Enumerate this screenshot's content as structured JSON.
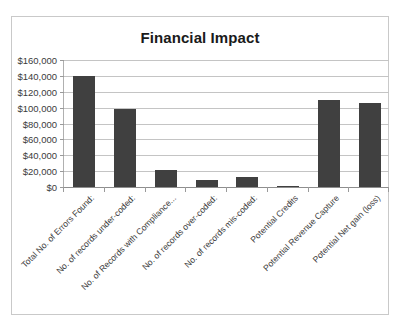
{
  "chart_data": {
    "type": "bar",
    "title": "Financial Impact",
    "xlabel": "",
    "ylabel": "",
    "ylim": [
      0,
      160000
    ],
    "grid": true,
    "legend": "none",
    "currency_prefix": "$",
    "categories": [
      "Total No. of Errors Found:",
      "No. of records under-coded:",
      "No. of Records with Compliance...",
      "No. of records over-coded:",
      "No. of records mis-coded:",
      "Potential Credits",
      "Potential Revenue Capture",
      "Potential Net gain (loss)"
    ],
    "values": [
      140000,
      98000,
      21000,
      9000,
      13000,
      1500,
      109000,
      106000
    ],
    "ytick_values": [
      0,
      20000,
      40000,
      60000,
      80000,
      100000,
      120000,
      140000,
      160000
    ],
    "ytick_labels": [
      "$0",
      "$20,000",
      "$40,000",
      "$60,000",
      "$80,000",
      "$100,000",
      "$120,000",
      "$140,000",
      "$160,000"
    ],
    "series": [
      {
        "name": "Financial Impact",
        "color": "#404040",
        "values": [
          140000,
          98000,
          21000,
          9000,
          13000,
          1500,
          109000,
          106000
        ]
      }
    ]
  }
}
